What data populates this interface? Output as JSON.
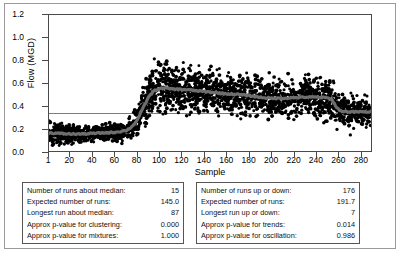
{
  "chart_data": {
    "type": "scatter",
    "title": "",
    "xlabel": "Sample",
    "ylabel": "Flow (MGD)",
    "xlim": [
      1,
      290
    ],
    "ylim": [
      0.0,
      1.2
    ],
    "grid": false,
    "legend": "none",
    "y_ticks": [
      "0.0",
      "0.2",
      "0.4",
      "0.6",
      "0.8",
      "1.0",
      "1.2"
    ],
    "y_tick_values": [
      0.0,
      0.2,
      0.4,
      0.6,
      0.8,
      1.0,
      1.2
    ],
    "x_ticks": [
      "1",
      "20",
      "40",
      "60",
      "80",
      "100",
      "120",
      "140",
      "160",
      "180",
      "200",
      "220",
      "240",
      "260",
      "280"
    ],
    "x_tick_values": [
      1,
      20,
      40,
      60,
      80,
      100,
      120,
      140,
      160,
      180,
      200,
      220,
      240,
      260,
      280
    ],
    "reference_line": {
      "value": 0.345,
      "label": "median"
    },
    "point_color": "#000000",
    "trend_color": "#6e6e6e",
    "series": [
      {
        "name": "Flow (MGD)",
        "marker": "filled-circle",
        "trend_x": [
          1,
          10,
          20,
          30,
          40,
          50,
          60,
          70,
          75,
          80,
          85,
          90,
          95,
          100,
          105,
          110,
          115,
          120,
          130,
          140,
          150,
          160,
          170,
          180,
          190,
          200,
          210,
          220,
          230,
          240,
          250,
          255,
          258,
          262,
          270,
          280,
          290
        ],
        "trend_y": [
          0.16,
          0.155,
          0.15,
          0.15,
          0.155,
          0.16,
          0.165,
          0.18,
          0.21,
          0.27,
          0.37,
          0.47,
          0.53,
          0.55,
          0.555,
          0.55,
          0.545,
          0.545,
          0.535,
          0.525,
          0.515,
          0.505,
          0.5,
          0.49,
          0.475,
          0.465,
          0.465,
          0.47,
          0.475,
          0.475,
          0.47,
          0.455,
          0.4,
          0.355,
          0.345,
          0.345,
          0.345
        ],
        "spread_x": [
          1,
          40,
          70,
          80,
          90,
          100,
          120,
          140,
          160,
          180,
          200,
          220,
          240,
          255,
          262,
          290
        ],
        "spread_hi": [
          0.46,
          0.3,
          0.34,
          0.62,
          0.92,
          1.06,
          0.97,
          0.92,
          0.82,
          0.86,
          0.82,
          0.86,
          0.9,
          0.92,
          0.72,
          0.62
        ],
        "spread_lo": [
          0.0,
          0.0,
          0.01,
          0.02,
          0.06,
          0.1,
          0.11,
          0.12,
          0.13,
          0.12,
          0.11,
          0.12,
          0.12,
          0.11,
          0.08,
          0.07
        ]
      }
    ]
  },
  "tables": {
    "left": {
      "name": "runs-about-median-results",
      "rows": [
        {
          "label": "Number of runs about median:",
          "value": "15"
        },
        {
          "label": "Expected number of runs:",
          "value": "145.0"
        },
        {
          "label": "Longest run about median:",
          "value": "87"
        },
        {
          "label": "Approx p-value for clustering:",
          "value": "0.000"
        },
        {
          "label": "Approx p-value for mixtures:",
          "value": "1.000"
        }
      ]
    },
    "right": {
      "name": "runs-up-or-down-results",
      "rows": [
        {
          "label": "Number of runs up or down:",
          "value": "176"
        },
        {
          "label": "Expected number of runs:",
          "value": "191.7"
        },
        {
          "label": "Longest run up or down:",
          "value": "7"
        },
        {
          "label": "Approx p-value for trends:",
          "value": "0.014"
        },
        {
          "label": "Approx p-value for oscillation:",
          "value": "0.986"
        }
      ]
    }
  }
}
